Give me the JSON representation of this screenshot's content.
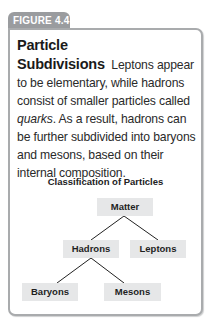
{
  "figure": {
    "label": "FIGURE 4.4",
    "heading": "Particle Subdivisions",
    "body_part1": "Leptons appear to be elementary, while hadrons consist of smaller particles called ",
    "body_italic": "quarks",
    "body_part2": ". As a result, hadrons can be further subdivided into baryons and mesons, based on their internal composition."
  },
  "diagram": {
    "title": "Classification of Particles",
    "nodes": {
      "root": "Matter",
      "hadrons": "Hadrons",
      "leptons": "Leptons",
      "baryons": "Baryons",
      "mesons": "Mesons"
    },
    "colors": {
      "node_fill": "#e6e7e8",
      "line": "#222222",
      "tab": "#9a9c9f",
      "border": "#a9abad"
    }
  }
}
